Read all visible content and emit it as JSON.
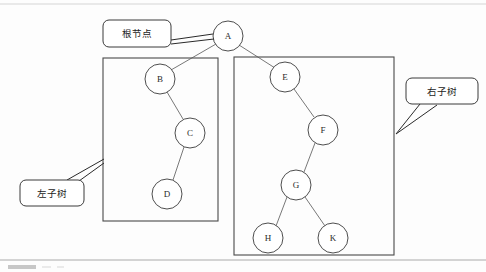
{
  "figure": {
    "background_color": "#fdfdfd",
    "stroke_color": "#4a4a4a",
    "node_fill": "#ffffff"
  },
  "nodes": [
    {
      "id": "A",
      "label": "A",
      "cx": 228,
      "cy": 36,
      "r": 15
    },
    {
      "id": "B",
      "label": "B",
      "cx": 160,
      "cy": 79,
      "r": 15
    },
    {
      "id": "C",
      "label": "C",
      "cx": 190,
      "cy": 133,
      "r": 15
    },
    {
      "id": "D",
      "label": "D",
      "cx": 167,
      "cy": 194,
      "r": 15
    },
    {
      "id": "E",
      "label": "E",
      "cx": 285,
      "cy": 77,
      "r": 15
    },
    {
      "id": "F",
      "label": "F",
      "cx": 323,
      "cy": 130,
      "r": 15
    },
    {
      "id": "G",
      "label": "G",
      "cx": 296,
      "cy": 185,
      "r": 15
    },
    {
      "id": "H",
      "label": "H",
      "cx": 268,
      "cy": 238,
      "r": 15
    },
    {
      "id": "K",
      "label": "K",
      "cx": 333,
      "cy": 238,
      "r": 15
    }
  ],
  "edges": [
    {
      "from": "A",
      "to": "B"
    },
    {
      "from": "A",
      "to": "E"
    },
    {
      "from": "B",
      "to": "C"
    },
    {
      "from": "C",
      "to": "D"
    },
    {
      "from": "E",
      "to": "F"
    },
    {
      "from": "F",
      "to": "G"
    },
    {
      "from": "G",
      "to": "H"
    },
    {
      "from": "G",
      "to": "K"
    }
  ],
  "group_boxes": [
    {
      "id": "left-subtree-box",
      "x": 103,
      "y": 58,
      "width": 115,
      "height": 163
    },
    {
      "id": "right-subtree-box",
      "x": 234,
      "y": 57,
      "width": 160,
      "height": 198
    }
  ],
  "callouts": [
    {
      "id": "root-callout",
      "label": "根节点",
      "x": 103,
      "y": 20,
      "width": 68,
      "height": 27,
      "text_x": 137,
      "text_y": 34,
      "leader": "M171,40 L213,34 M171,44 L213,38"
    },
    {
      "id": "left-subtree-callout",
      "label": "左子树",
      "x": 20,
      "y": 180,
      "width": 64,
      "height": 26,
      "text_x": 52,
      "text_y": 193,
      "leader": "M68,180 L104,159 M78,181 L104,162"
    },
    {
      "id": "right-subtree-callout",
      "label": "右子树",
      "x": 406,
      "y": 78,
      "width": 72,
      "height": 26,
      "text_x": 442,
      "text_y": 91,
      "leader": "M419,104 L396,134 M436,105 L396,134"
    }
  ],
  "frame": {
    "top_y": 4,
    "bottom_y": 260,
    "left_x": 0,
    "right_x": 486
  },
  "caption_fragment": {
    "x": 8,
    "y": 265,
    "width": 28,
    "height": 4
  }
}
